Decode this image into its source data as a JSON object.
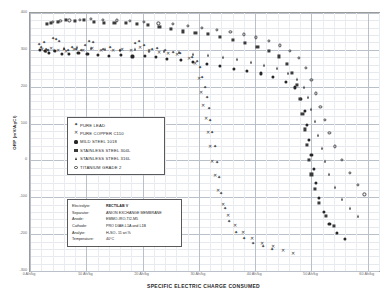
{
  "chart_data": {
    "type": "scatter",
    "title": "",
    "xlabel": "SPECIFIC ELECTRIC CHARGE CONSUMED",
    "ylabel": "ORP (mV/AgCl)",
    "xlim": [
      0,
      62
    ],
    "ylim": [
      -300,
      400
    ],
    "grid": true,
    "legend_position": "inside-left",
    "xticks": [
      "0 Ah/kg",
      "10 Ah/kg",
      "20 Ah/kg",
      "30 Ah/kg",
      "40 Ah/kg",
      "50 Ah/kg",
      "60 Ah/kg"
    ],
    "xtick_values": [
      0,
      10,
      20,
      30,
      40,
      50,
      60
    ],
    "yticks": [
      "400",
      "300",
      "200",
      "100",
      "0",
      "-100",
      "-200",
      "-300"
    ],
    "ytick_values": [
      400,
      300,
      200,
      100,
      0,
      -100,
      -200,
      -300
    ],
    "series": [
      {
        "name": "PURE LEAD",
        "marker": "plus",
        "points": [
          [
            1.6,
            312
          ],
          [
            2.0,
            305
          ],
          [
            2.4,
            318
          ],
          [
            2.8,
            300
          ],
          [
            3.2,
            296
          ],
          [
            4.0,
            330
          ],
          [
            4.6,
            326
          ],
          [
            5.2,
            322
          ],
          [
            6.1,
            300
          ],
          [
            6.8,
            297
          ],
          [
            7.4,
            305
          ],
          [
            8.2,
            300
          ],
          [
            9.0,
            296
          ],
          [
            9.8,
            310
          ],
          [
            10.4,
            322
          ],
          [
            11.2,
            318
          ],
          [
            13.0,
            300
          ],
          [
            14.2,
            306
          ],
          [
            16.0,
            296
          ],
          [
            18.6,
            316
          ],
          [
            19.4,
            320
          ],
          [
            20.2,
            310
          ],
          [
            21.6,
            300
          ],
          [
            22.6,
            302
          ],
          [
            24.0,
            296
          ],
          [
            25.4,
            292
          ],
          [
            26.6,
            290
          ],
          [
            28.8,
            278
          ],
          [
            29.6,
            268
          ],
          [
            30.2,
            250
          ],
          [
            30.6,
            225
          ],
          [
            31.0,
            196
          ],
          [
            31.4,
            170
          ],
          [
            31.8,
            140
          ],
          [
            32.0,
            108
          ],
          [
            32.4,
            74
          ],
          [
            32.8,
            36
          ],
          [
            33.2,
            -8
          ],
          [
            33.6,
            -48
          ],
          [
            34.0,
            -92
          ],
          [
            34.6,
            -132
          ],
          [
            35.4,
            -168
          ],
          [
            36.6,
            -196
          ],
          [
            38.0,
            -214
          ],
          [
            39.6,
            -226
          ],
          [
            41.4,
            -236
          ],
          [
            43.0,
            -242
          ]
        ]
      },
      {
        "name": "PURE COPPER C110",
        "marker": "x",
        "points": [
          [
            2.2,
            300
          ],
          [
            3.0,
            296
          ],
          [
            3.8,
            302
          ],
          [
            5.0,
            298
          ],
          [
            6.4,
            294
          ],
          [
            7.8,
            300
          ],
          [
            9.4,
            296
          ],
          [
            11.0,
            302
          ],
          [
            12.6,
            298
          ],
          [
            14.8,
            296
          ],
          [
            16.4,
            300
          ],
          [
            18.0,
            296
          ],
          [
            19.6,
            304
          ],
          [
            21.2,
            298
          ],
          [
            23.0,
            292
          ],
          [
            24.6,
            288
          ],
          [
            26.2,
            286
          ],
          [
            28.2,
            276
          ],
          [
            29.4,
            262
          ],
          [
            30.0,
            220
          ],
          [
            30.4,
            182
          ],
          [
            30.8,
            148
          ],
          [
            31.2,
            112
          ],
          [
            31.6,
            74
          ],
          [
            32.0,
            36
          ],
          [
            32.4,
            -4
          ],
          [
            32.8,
            -42
          ],
          [
            33.4,
            -82
          ],
          [
            34.2,
            -120
          ],
          [
            35.2,
            -152
          ],
          [
            36.4,
            -178
          ],
          [
            37.8,
            -198
          ],
          [
            39.4,
            -214
          ],
          [
            41.2,
            -226
          ],
          [
            43.2,
            -236
          ],
          [
            45.0,
            -246
          ],
          [
            46.8,
            -254
          ]
        ]
      },
      {
        "name": "MILD STEEL 1018",
        "marker": "circle-filled",
        "points": [
          [
            1.8,
            300
          ],
          [
            2.6,
            296
          ],
          [
            3.4,
            292
          ],
          [
            4.4,
            296
          ],
          [
            5.6,
            290
          ],
          [
            7.0,
            288
          ],
          [
            8.6,
            292
          ],
          [
            10.2,
            288
          ],
          [
            12.0,
            286
          ],
          [
            14.0,
            284
          ],
          [
            16.2,
            286
          ],
          [
            18.2,
            282
          ],
          [
            20.4,
            284
          ],
          [
            22.4,
            280
          ],
          [
            24.4,
            276
          ],
          [
            26.8,
            272
          ],
          [
            29.0,
            268
          ],
          [
            31.4,
            262
          ],
          [
            33.8,
            256
          ],
          [
            36.2,
            248
          ],
          [
            38.6,
            242
          ],
          [
            41.0,
            236
          ],
          [
            43.2,
            226
          ],
          [
            45.4,
            214
          ],
          [
            47.0,
            198
          ],
          [
            48.2,
            168
          ],
          [
            48.8,
            134
          ],
          [
            49.2,
            96
          ],
          [
            49.6,
            56
          ],
          [
            50.0,
            16
          ],
          [
            50.4,
            -24
          ],
          [
            50.8,
            -62
          ],
          [
            51.4,
            -102
          ],
          [
            52.2,
            -140
          ],
          [
            53.2,
            -172
          ],
          [
            54.6,
            -196
          ],
          [
            56.0,
            -212
          ]
        ]
      },
      {
        "name": "STAINLESS STEEL 304L",
        "marker": "square-filled",
        "points": [
          [
            3.0,
            370
          ],
          [
            3.8,
            372
          ],
          [
            5.0,
            376
          ],
          [
            6.4,
            380
          ],
          [
            8.0,
            378
          ],
          [
            9.6,
            382
          ],
          [
            11.4,
            376
          ],
          [
            13.2,
            374
          ],
          [
            15.0,
            372
          ],
          [
            17.0,
            374
          ],
          [
            19.0,
            370
          ],
          [
            21.0,
            368
          ],
          [
            23.0,
            362
          ],
          [
            25.0,
            356
          ],
          [
            27.2,
            350
          ],
          [
            29.4,
            346
          ],
          [
            31.6,
            342
          ],
          [
            33.8,
            334
          ],
          [
            36.0,
            326
          ],
          [
            38.2,
            318
          ],
          [
            40.4,
            308
          ],
          [
            42.4,
            296
          ],
          [
            44.2,
            282
          ],
          [
            45.6,
            262
          ],
          [
            46.6,
            238
          ],
          [
            47.4,
            206
          ],
          [
            48.0,
            168
          ],
          [
            48.4,
            126
          ],
          [
            48.8,
            84
          ],
          [
            49.2,
            42
          ],
          [
            49.6,
            2
          ],
          [
            50.0,
            -38
          ],
          [
            50.6,
            -78
          ],
          [
            51.4,
            -116
          ],
          [
            52.6,
            -150
          ],
          [
            54.0,
            -178
          ]
        ]
      },
      {
        "name": "STAINLESS STEEL 316L",
        "marker": "triangle-filled",
        "points": [
          [
            2.8,
            296
          ],
          [
            4.2,
            300
          ],
          [
            6.0,
            304
          ],
          [
            8.4,
            308
          ],
          [
            10.8,
            306
          ],
          [
            13.4,
            302
          ],
          [
            16.0,
            300
          ],
          [
            18.6,
            302
          ],
          [
            21.2,
            298
          ],
          [
            23.8,
            296
          ],
          [
            26.4,
            294
          ],
          [
            29.0,
            290
          ],
          [
            31.6,
            286
          ],
          [
            34.2,
            280
          ],
          [
            36.8,
            274
          ],
          [
            39.2,
            268
          ],
          [
            41.6,
            260
          ],
          [
            43.8,
            250
          ],
          [
            45.8,
            238
          ],
          [
            47.4,
            222
          ],
          [
            48.6,
            200
          ],
          [
            49.4,
            172
          ],
          [
            50.0,
            140
          ],
          [
            50.6,
            106
          ],
          [
            51.2,
            70
          ],
          [
            51.8,
            34
          ],
          [
            52.4,
            -2
          ],
          [
            53.2,
            -38
          ],
          [
            54.2,
            -72
          ],
          [
            55.4,
            -104
          ],
          [
            56.8,
            -130
          ],
          [
            58.2,
            -150
          ]
        ]
      },
      {
        "name": "TITANIUM GRADE 2",
        "marker": "circle-open",
        "points": [
          [
            4.0,
            376
          ],
          [
            5.4,
            378
          ],
          [
            7.0,
            380
          ],
          [
            8.8,
            382
          ],
          [
            10.8,
            384
          ],
          [
            13.0,
            382
          ],
          [
            15.4,
            380
          ],
          [
            17.8,
            378
          ],
          [
            20.2,
            376
          ],
          [
            22.8,
            372
          ],
          [
            25.4,
            370
          ],
          [
            28.0,
            366
          ],
          [
            30.6,
            360
          ],
          [
            33.2,
            354
          ],
          [
            35.6,
            348
          ],
          [
            38.0,
            342
          ],
          [
            40.2,
            334
          ],
          [
            42.4,
            324
          ],
          [
            44.4,
            312
          ],
          [
            46.2,
            298
          ],
          [
            47.8,
            278
          ],
          [
            49.0,
            252
          ],
          [
            50.0,
            218
          ],
          [
            50.8,
            182
          ],
          [
            51.6,
            146
          ],
          [
            52.4,
            110
          ],
          [
            53.2,
            74
          ],
          [
            54.2,
            38
          ],
          [
            55.4,
            2
          ],
          [
            56.8,
            -34
          ],
          [
            58.2,
            -66
          ],
          [
            59.4,
            -92
          ]
        ]
      }
    ]
  },
  "legend": {
    "items": [
      {
        "label": "PURE LEAD",
        "marker": "plus"
      },
      {
        "label": "PURE COPPER C110",
        "marker": "x"
      },
      {
        "label": "MILD STEEL 1018",
        "marker": "circle-filled"
      },
      {
        "label": "STAINLESS  STEEL 304L",
        "marker": "square-filled"
      },
      {
        "label": "STAINLESS STEEL 316L",
        "marker": "triangle-filled"
      },
      {
        "label": "TITANIUM GRADE 2",
        "marker": "circle-open"
      }
    ]
  },
  "info_box": {
    "rows": [
      {
        "key": "Electrolyte:",
        "value": "RECTILAB V",
        "bold": true
      },
      {
        "key": "Separator:",
        "value": "ANION EXCHANGE MEMBRANE",
        "bold": false
      },
      {
        "key": "Anode:",
        "value": "EMMO-IRO-TI2-M5",
        "bold": false
      },
      {
        "key": "Cathode:",
        "value": "PRO DIAE-L1A and L1B",
        "bold": false
      },
      {
        "key": "Analyte:",
        "value": "H₂SO₄ 11 wt.%",
        "bold": false
      },
      {
        "key": "Temperature:",
        "value": "40°C",
        "bold": false
      }
    ]
  },
  "axes": {
    "x_title": "SPECIFIC ELECTRIC CHARGE CONSUMED",
    "y_title": "ORP (mV/AgCl)"
  }
}
